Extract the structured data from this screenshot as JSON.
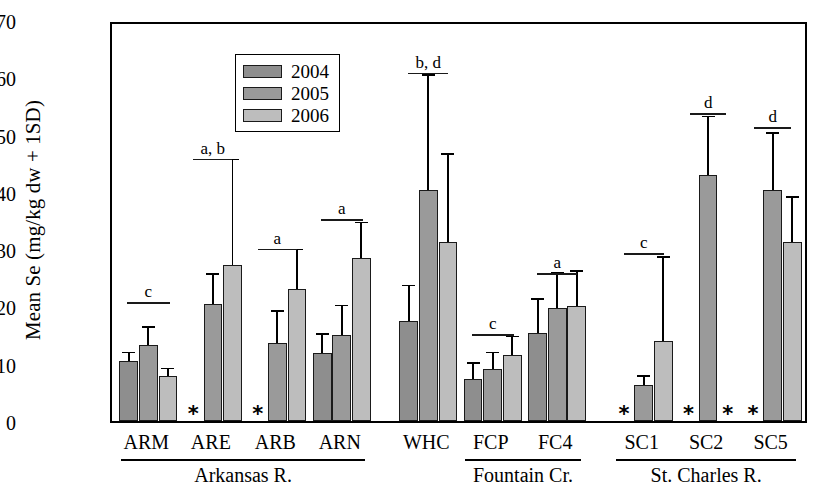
{
  "chart_data": {
    "type": "bar",
    "title": "",
    "xlabel": "",
    "ylabel": "Mean Se (mg/kg dw + 1SD)",
    "ylim": [
      0,
      70
    ],
    "yticks": [
      0,
      10,
      20,
      30,
      40,
      50,
      60,
      70
    ],
    "grid": false,
    "legend_position": "top-left",
    "legend": [
      "2004",
      "2005",
      "2006"
    ],
    "categories": [
      "ARM",
      "ARE",
      "ARB",
      "ARN",
      "WHC",
      "FCP",
      "FC4",
      "SC1",
      "SC2",
      "SC5"
    ],
    "series": [
      {
        "name": "2004",
        "values": [
          10.5,
          null,
          null,
          11.8,
          17.5,
          7.3,
          15.3,
          null,
          null,
          null
        ],
        "errors": [
          1.3,
          null,
          null,
          3.2,
          6.0,
          2.7,
          5.9,
          null,
          null,
          null
        ]
      },
      {
        "name": "2005",
        "values": [
          13.3,
          20.5,
          13.7,
          15.0,
          40.3,
          9.0,
          19.7,
          6.2,
          42.9,
          40.3
        ],
        "errors": [
          2.9,
          5.0,
          5.3,
          5.0,
          20.0,
          2.8,
          6.0,
          1.5,
          10.1,
          9.8
        ]
      },
      {
        "name": "2006",
        "values": [
          7.8,
          27.3,
          23.0,
          28.4,
          31.3,
          11.5,
          20.1,
          14.0,
          null,
          31.2
        ],
        "errors": [
          1.2,
          18.2,
          6.8,
          6.1,
          15.2,
          3.1,
          5.9,
          14.5,
          null,
          7.7
        ]
      }
    ],
    "missing_markers": {
      "symbol": "*",
      "at": [
        {
          "category": "ARE",
          "year": "2004"
        },
        {
          "category": "ARB",
          "year": "2004"
        },
        {
          "category": "SC1",
          "year": "2004"
        },
        {
          "category": "SC2",
          "year": "2004"
        },
        {
          "category": "SC2",
          "year": "2006"
        },
        {
          "category": "SC5",
          "year": "2004"
        }
      ]
    },
    "significance_annotations": [
      {
        "category": "ARM",
        "label": "c"
      },
      {
        "category": "ARE",
        "label": "a, b"
      },
      {
        "category": "ARB",
        "label": "a"
      },
      {
        "category": "ARN",
        "label": "a"
      },
      {
        "category": "WHC",
        "label": "b, d"
      },
      {
        "category": "FCP",
        "label": "c"
      },
      {
        "category": "FC4",
        "label": "a"
      },
      {
        "category": "SC1",
        "label": "c"
      },
      {
        "category": "SC2",
        "label": "d"
      },
      {
        "category": "SC5",
        "label": "d"
      }
    ],
    "category_groups": [
      {
        "label": "Arkansas R.",
        "members": [
          "ARM",
          "ARE",
          "ARB",
          "ARN"
        ]
      },
      {
        "label": "Fountain Cr.",
        "members": [
          "FCP",
          "FC4"
        ]
      },
      {
        "label": "St. Charles R.",
        "members": [
          "SC1",
          "SC2",
          "SC5"
        ]
      }
    ],
    "colors": {
      "2004": "#8e8e8e",
      "2005": "#9a9a9a",
      "2006": "#bdbdbd",
      "axis": "#000000",
      "background": "#ffffff"
    }
  }
}
